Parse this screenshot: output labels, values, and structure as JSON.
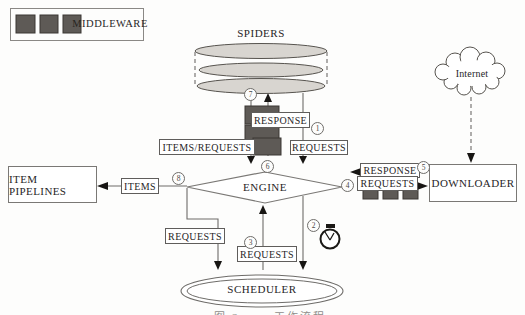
{
  "legend": {
    "label": "MIDDLEWARE"
  },
  "nodes": {
    "spiders": {
      "label": "SPIDERS"
    },
    "engine": {
      "label": "ENGINE"
    },
    "scheduler": {
      "label": "SCHEDULER"
    },
    "downloader": {
      "label": "DOWNLOADER"
    },
    "item_pipelines": {
      "label": "ITEM PIPELINES"
    },
    "internet": {
      "label": "Internet"
    }
  },
  "flows": {
    "response_to_spiders": "RESPONSE",
    "items_requests_to_engine": "ITEMS/REQUESTS",
    "requests_from_spiders": "REQUESTS",
    "items_to_pipelines": "ITEMS",
    "requests_to_scheduler_left": "REQUESTS",
    "requests_from_scheduler": "REQUESTS",
    "response_from_downloader": "RESPONSE",
    "requests_to_downloader": "REQUESTS"
  },
  "step_numbers": {
    "n1": "1",
    "n2": "2",
    "n3": "3",
    "n4": "4",
    "n5": "5",
    "n6": "6",
    "n7": "7",
    "n8": "8"
  },
  "caption": "图 Scrapy工作流程",
  "colors": {
    "middleware_fill": "#5e5a56",
    "middleware_border": "#3a3733",
    "spider_fill": "#d8d5d0",
    "line": "#6e6c69",
    "arrow": "#171513"
  }
}
